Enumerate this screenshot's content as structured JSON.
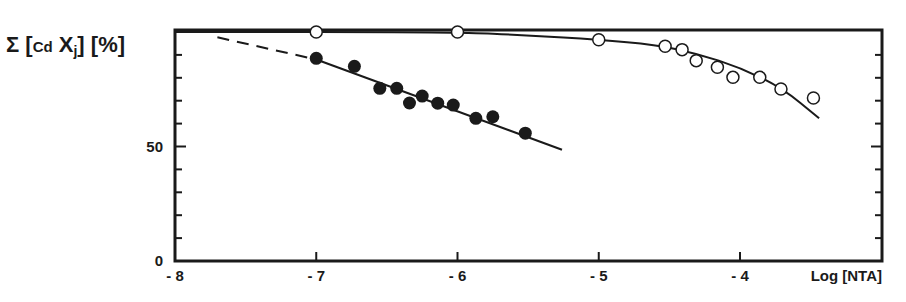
{
  "chart_data": {
    "type": "scatter",
    "title": "",
    "xlabel": "Log [NTA]",
    "ylabel": "Σ [Cd Xj] [%]",
    "xlim": [
      -8,
      -3.0
    ],
    "ylim": [
      0,
      100
    ],
    "x_ticks": [
      -8,
      -7,
      -6,
      -5,
      -4
    ],
    "x_tick_labels": [
      "-8",
      "-7",
      "-6",
      "-5",
      "-4"
    ],
    "y_ticks": [
      0,
      50
    ],
    "y_tick_labels": [
      "0",
      "50"
    ],
    "y_minor_ticks": [
      10,
      20,
      30,
      40,
      60,
      70,
      80,
      90
    ],
    "grid": false,
    "legend": null,
    "series": [
      {
        "name": "open circles",
        "marker": "open-circle",
        "x": [
          -7.0,
          -6.0,
          -5.0,
          -4.53,
          -4.41,
          -4.31,
          -4.16,
          -4.05,
          -3.86,
          -3.71,
          -3.48
        ],
        "y": [
          100,
          100,
          96.6,
          93.8,
          92.3,
          87.5,
          84.6,
          80.2,
          80.2,
          75.1,
          71.2
        ],
        "fit_curve": {
          "style": "solid",
          "x": [
            -8.0,
            -6.0,
            -5.5,
            -5.0,
            -4.6,
            -4.3,
            -4.0,
            -3.7,
            -3.44
          ],
          "y": [
            100,
            100,
            98.5,
            96.6,
            94.5,
            90.5,
            84.5,
            75.5,
            62.3
          ]
        }
      },
      {
        "name": "filled circles",
        "marker": "filled-circle",
        "x": [
          -7.0,
          -6.73,
          -6.55,
          -6.43,
          -6.34,
          -6.25,
          -6.14,
          -6.03,
          -5.87,
          -5.75,
          -5.52
        ],
        "y": [
          88.5,
          85.0,
          75.4,
          75.4,
          69.0,
          72.0,
          68.9,
          68.1,
          62.3,
          63.0,
          55.8
        ],
        "fit_line": {
          "style": "solid",
          "x": [
            -7.0,
            -5.26
          ],
          "y": [
            88.0,
            48.6
          ]
        },
        "extrapolation": {
          "style": "dashed",
          "x": [
            -7.7,
            -7.0
          ],
          "y": [
            97.7,
            88.0
          ]
        }
      }
    ]
  },
  "labels": {
    "y_axis_sigma": "Σ",
    "y_axis_open": "[",
    "y_axis_cd": "Cd",
    "y_axis_x": "X",
    "y_axis_j": "j",
    "y_axis_close": "]",
    "y_axis_unit": "[%]",
    "x_axis": "Log [NTA]"
  }
}
